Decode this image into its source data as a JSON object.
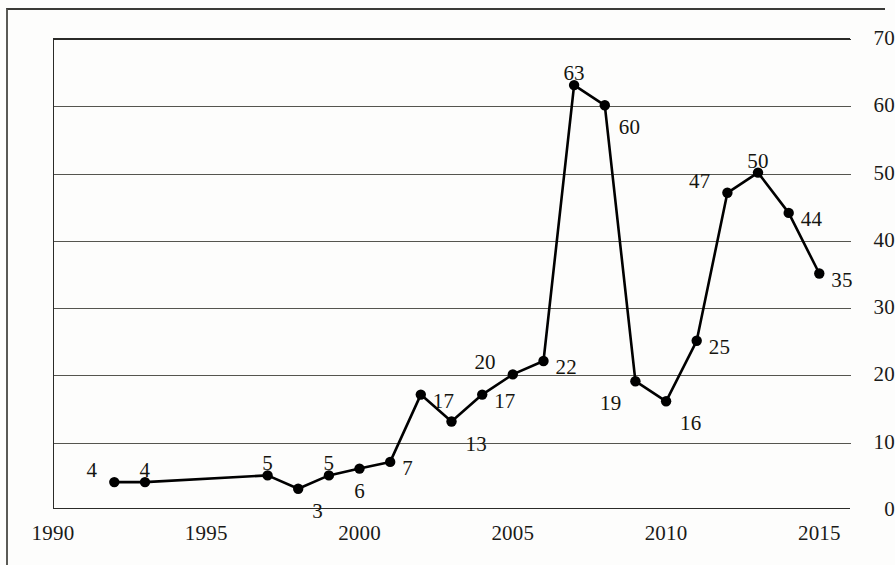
{
  "chart_data": {
    "type": "line",
    "title": "",
    "subtitle": "",
    "xlabel": "",
    "ylabel": "",
    "xlim": [
      1990,
      2016
    ],
    "ylim": [
      0,
      70
    ],
    "grid": true,
    "legend": false,
    "legend_position": "none",
    "marker": "filled-circle",
    "line_color": "#000000",
    "marker_color": "#000000",
    "grid_color": "#55554f",
    "x": [
      1992,
      1993,
      1997,
      1998,
      1999,
      2000,
      2001,
      2002,
      2003,
      2004,
      2005,
      2006,
      2007,
      2008,
      2009,
      2010,
      2011,
      2012,
      2013,
      2014,
      2015
    ],
    "values": [
      4,
      4,
      5,
      3,
      5,
      6,
      7,
      17,
      13,
      17,
      20,
      22,
      63,
      60,
      19,
      16,
      25,
      47,
      50,
      44,
      35
    ],
    "point_labels": [
      "4",
      "4",
      "5",
      "3",
      "5",
      "6",
      "7",
      "17",
      "13",
      "17",
      "20",
      "22",
      "63",
      "60",
      "19",
      "16",
      "25",
      "47",
      "50",
      "44",
      "35"
    ],
    "label_placement": [
      "above-left",
      "above",
      "above",
      "below-right",
      "above",
      "below",
      "right",
      "right",
      "below-right",
      "right",
      "above-left",
      "right",
      "above",
      "below-right",
      "below-left",
      "below-right",
      "right",
      "above-left",
      "above",
      "right",
      "right"
    ],
    "y_ticks": [
      0,
      10,
      20,
      30,
      40,
      50,
      60,
      70
    ],
    "y_tick_labels": [
      "0",
      "10",
      "20",
      "30",
      "40",
      "50",
      "60",
      "70"
    ],
    "x_ticks": [
      1990,
      1995,
      2000,
      2005,
      2010,
      2015
    ],
    "x_tick_labels": [
      "1990",
      "1995",
      "2000",
      "2005",
      "2010",
      "2015"
    ]
  }
}
